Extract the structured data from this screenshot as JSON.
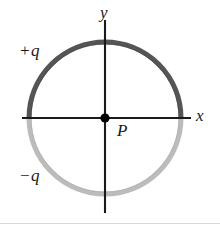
{
  "figure": {
    "axes": {
      "x_label": "x",
      "y_label": "y"
    },
    "labels": {
      "positive_charge": "+q",
      "negative_charge": "−q",
      "center_point": "P"
    },
    "colors": {
      "upper_arc": "#555555",
      "lower_arc": "#bcbcbc",
      "axis": "#1a1a1a",
      "point": "#000000",
      "background": "#ffffff",
      "bottom_rule": "#d8d8d8"
    },
    "geometry": {
      "center_x": 105,
      "center_y": 118,
      "radius": 76,
      "ring_thickness": 5,
      "x_axis_start": 22,
      "x_axis_end": 191,
      "y_axis_start": 20,
      "y_axis_end": 213
    }
  }
}
